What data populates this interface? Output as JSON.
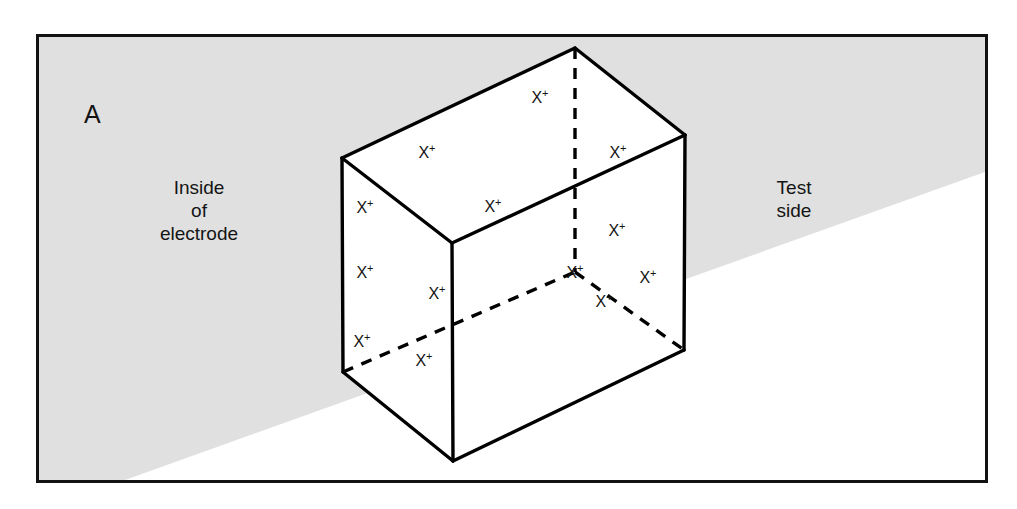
{
  "figure": {
    "panel_letter": "A",
    "frame_border_color": "#121212",
    "shaded_region_color": "#e0e0e0",
    "unshaded_region_color": "#ffffff",
    "line_color": "#000000"
  },
  "region_labels": {
    "left": {
      "name": "inside-of-electrode",
      "lines": [
        "Inside",
        "of",
        "electrode"
      ],
      "text": "Inside\nof\nelectrode"
    },
    "right": {
      "name": "test-side",
      "lines": [
        "Test",
        "side"
      ],
      "text": "Test\nside"
    }
  },
  "ion": {
    "symbol": "X",
    "charge": "+",
    "label": "X+"
  },
  "ion_markers": [
    {
      "id": "top-face-1",
      "face": "top",
      "x": 540,
      "y": 97
    },
    {
      "id": "top-face-2",
      "face": "top",
      "x": 427,
      "y": 152
    },
    {
      "id": "top-face-3",
      "face": "top",
      "x": 618,
      "y": 152
    },
    {
      "id": "top-face-4",
      "face": "top",
      "x": 493,
      "y": 206
    },
    {
      "id": "left-face-1",
      "face": "left",
      "x": 365,
      "y": 207
    },
    {
      "id": "left-face-2",
      "face": "left",
      "x": 365,
      "y": 272
    },
    {
      "id": "left-face-3",
      "face": "left",
      "x": 437,
      "y": 293
    },
    {
      "id": "left-face-4",
      "face": "left",
      "x": 362,
      "y": 341
    },
    {
      "id": "left-face-5",
      "face": "left",
      "x": 424,
      "y": 360
    },
    {
      "id": "right-face-1",
      "face": "right",
      "x": 617,
      "y": 230
    },
    {
      "id": "right-face-2",
      "face": "right",
      "x": 648,
      "y": 277
    },
    {
      "id": "right-face-3",
      "face": "right",
      "x": 604,
      "y": 301
    },
    {
      "id": "interior-1",
      "face": "interior",
      "x": 575,
      "y": 272
    }
  ],
  "geometry": {
    "description": "Isometric wireframe cuboid; solid lines are visible edges, dashed lines are hidden edges",
    "vertices": {
      "top_back": [
        575,
        48
      ],
      "top_left": [
        342,
        158
      ],
      "top_right": [
        685,
        135
      ],
      "top_front": [
        452,
        243
      ],
      "bottom_left": [
        343,
        372
      ],
      "bottom_right": [
        684,
        350
      ],
      "bottom_front": [
        453,
        461
      ],
      "bottom_back_hidden": [
        575,
        272
      ]
    },
    "solid_edges": [
      [
        [
          342,
          158
        ],
        [
          575,
          48
        ]
      ],
      [
        [
          575,
          48
        ],
        [
          685,
          135
        ]
      ],
      [
        [
          685,
          135
        ],
        [
          452,
          243
        ]
      ],
      [
        [
          452,
          243
        ],
        [
          342,
          158
        ]
      ],
      [
        [
          342,
          158
        ],
        [
          343,
          372
        ]
      ],
      [
        [
          452,
          243
        ],
        [
          453,
          461
        ]
      ],
      [
        [
          685,
          135
        ],
        [
          684,
          350
        ]
      ],
      [
        [
          343,
          372
        ],
        [
          453,
          461
        ]
      ],
      [
        [
          453,
          461
        ],
        [
          684,
          350
        ]
      ]
    ],
    "dashed_edges": [
      [
        [
          575,
          48
        ],
        [
          575,
          272
        ]
      ],
      [
        [
          343,
          372
        ],
        [
          575,
          272
        ]
      ],
      [
        [
          575,
          272
        ],
        [
          684,
          350
        ]
      ]
    ],
    "shade_boundary": [
      [
        125,
        483
      ],
      [
        988,
        175
      ]
    ]
  }
}
